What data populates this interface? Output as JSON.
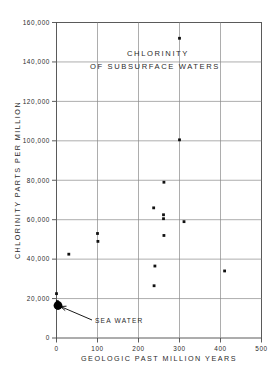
{
  "chart_data": {
    "type": "scatter",
    "title": "CHLORINITY OF SUBSURFACE WATERS",
    "title_line1": "CHLORINITY",
    "title_line2": "OF SUBSURFACE WATERS",
    "xlabel": "GEOLOGIC PAST MILLION YEARS",
    "ylabel": "CHLORINITY PARTS PER MILLION",
    "xlim": [
      0,
      500
    ],
    "ylim": [
      0,
      160000
    ],
    "grid": true,
    "legend": "none",
    "xticks": [
      0,
      100,
      200,
      300,
      400,
      500
    ],
    "xticklabels": [
      "0",
      "100",
      "200",
      "300",
      "400",
      "500"
    ],
    "yticks": [
      0,
      20000,
      40000,
      60000,
      80000,
      100000,
      120000,
      140000,
      160000
    ],
    "yticklabels": [
      "0",
      "20,000",
      "40,000",
      "60,000",
      "80,000",
      "100,000",
      "120,000",
      "140,000",
      "160,000"
    ],
    "points": [
      {
        "x": 0,
        "y": 22500,
        "label": ""
      },
      {
        "x": 2,
        "y": 18500,
        "label": ""
      },
      {
        "x": 30,
        "y": 42500,
        "label": ""
      },
      {
        "x": 100,
        "y": 53000,
        "label": ""
      },
      {
        "x": 101,
        "y": 49000,
        "label": ""
      },
      {
        "x": 238,
        "y": 26500,
        "label": ""
      },
      {
        "x": 240,
        "y": 36500,
        "label": ""
      },
      {
        "x": 237,
        "y": 66000,
        "label": ""
      },
      {
        "x": 262,
        "y": 79000,
        "label": ""
      },
      {
        "x": 261,
        "y": 62500,
        "label": ""
      },
      {
        "x": 261,
        "y": 60500,
        "label": ""
      },
      {
        "x": 262,
        "y": 52000,
        "label": ""
      },
      {
        "x": 300,
        "y": 152000,
        "label": ""
      },
      {
        "x": 300,
        "y": 100500,
        "label": ""
      },
      {
        "x": 311,
        "y": 59000,
        "label": ""
      },
      {
        "x": 410,
        "y": 34000,
        "label": ""
      }
    ],
    "annotations": [
      {
        "text": "SEA WATER",
        "x": 3,
        "y": 17000,
        "marker": "large-filled-circle"
      }
    ]
  }
}
